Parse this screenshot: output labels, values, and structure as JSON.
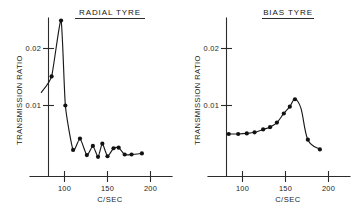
{
  "figure": {
    "background": "#ffffff",
    "ink": "#1a1a1a",
    "panel_count": 2
  },
  "panels": {
    "left": {
      "title": "RADIAL TYRE",
      "xlabel": "C/SEC",
      "ylabel": "TRANSMISSION RATIO",
      "ytick_labels": [
        "0.02",
        "0.01"
      ],
      "xtick_labels": [
        "100",
        "150",
        "200"
      ]
    },
    "right": {
      "title": "BIAS TYRE",
      "xlabel": "C/SEC",
      "ylabel": "TRANSMISSION RATIO",
      "ytick_labels": [
        "0.02",
        "0.01"
      ],
      "xtick_labels": [
        "100",
        "150",
        "200"
      ]
    }
  },
  "chart_data": [
    {
      "type": "line",
      "title": "RADIAL TYRE",
      "xlabel": "C/SEC",
      "ylabel": "TRANSMISSION RATIO",
      "xlim": [
        70,
        210
      ],
      "ylim": [
        0,
        0.026
      ],
      "xticks": [
        100,
        150,
        200
      ],
      "xtick_labels": [
        "100",
        "150",
        "200"
      ],
      "yticks": [
        0.02,
        0.01
      ],
      "ytick_labels": [
        "0.02",
        "0.01"
      ],
      "grid": false,
      "legend": null,
      "markers": "filled-circle",
      "series": [
        {
          "name": "Radial tyre transmission ratio",
          "x": [
            73,
            85,
            96,
            101,
            110,
            118,
            126,
            133,
            139,
            144,
            150,
            157,
            163,
            170,
            178,
            190
          ],
          "y": [
            0.0123,
            0.0151,
            0.0249,
            0.01,
            0.0022,
            0.0042,
            0.0013,
            0.0029,
            0.001,
            0.0033,
            0.0011,
            0.0025,
            0.0026,
            0.0014,
            0.0014,
            0.0016
          ],
          "point_visible": [
            false,
            true,
            true,
            true,
            true,
            true,
            true,
            true,
            true,
            true,
            true,
            true,
            true,
            true,
            true,
            true
          ]
        }
      ]
    },
    {
      "type": "line",
      "title": "BIAS TYRE",
      "xlabel": "C/SEC",
      "ylabel": "TRANSMISSION RATIO",
      "xlim": [
        70,
        210
      ],
      "ylim": [
        0,
        0.026
      ],
      "xticks": [
        100,
        150,
        200
      ],
      "xtick_labels": [
        "100",
        "150",
        "200"
      ],
      "yticks": [
        0.02,
        0.01
      ],
      "ytick_labels": [
        "0.02",
        "0.01"
      ],
      "grid": false,
      "legend": null,
      "markers": "filled-circle",
      "series": [
        {
          "name": "Bias tyre transmission ratio",
          "x": [
            84,
            95,
            105,
            114,
            124,
            132,
            140,
            148,
            155,
            161,
            168,
            176,
            190
          ],
          "y": [
            0.005,
            0.005,
            0.0051,
            0.0053,
            0.0058,
            0.0062,
            0.007,
            0.0086,
            0.0098,
            0.0111,
            0.0095,
            0.004,
            0.0023
          ],
          "point_visible": [
            true,
            true,
            true,
            true,
            true,
            true,
            true,
            true,
            true,
            true,
            false,
            true,
            true
          ]
        }
      ]
    }
  ]
}
